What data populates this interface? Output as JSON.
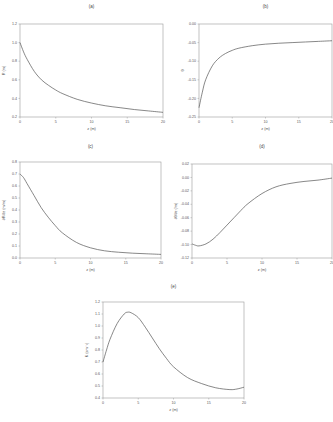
{
  "chart_data": [
    {
      "id": "a",
      "type": "line",
      "title": "(a)",
      "xlabel": "z (m)",
      "ylabel": "R (m)",
      "xlim": [
        0,
        20
      ],
      "ylim": [
        0.2,
        1.2
      ],
      "xticks": [
        "0",
        "5",
        "10",
        "15",
        "20"
      ],
      "yticks": [
        "0.2",
        "0.4",
        "0.6",
        "0.8",
        "1.0",
        "1.2"
      ],
      "grid": false,
      "x": [
        0,
        0.5,
        1,
        2,
        3,
        4,
        5,
        6,
        8,
        10,
        12,
        14,
        16,
        18,
        20
      ],
      "y": [
        1.0,
        0.9,
        0.82,
        0.69,
        0.6,
        0.54,
        0.49,
        0.45,
        0.39,
        0.35,
        0.32,
        0.3,
        0.28,
        0.265,
        0.25
      ]
    },
    {
      "id": "b",
      "type": "line",
      "title": "(b)",
      "xlabel": "z (m)",
      "ylabel": "θ",
      "xlim": [
        0,
        20
      ],
      "ylim": [
        -0.25,
        0.05
      ],
      "xticks": [
        "0",
        "5",
        "10",
        "15",
        "20"
      ],
      "yticks": [
        "-0.25",
        "-0.20",
        "-0.15",
        "-0.10",
        "-0.05",
        "0.00"
      ],
      "grid": false,
      "x": [
        0,
        0.5,
        1,
        2,
        3,
        4,
        5,
        6,
        8,
        10,
        12,
        14,
        16,
        18,
        20
      ],
      "y": [
        -0.22,
        -0.17,
        -0.13,
        -0.085,
        -0.06,
        -0.045,
        -0.035,
        -0.028,
        -0.02,
        -0.015,
        -0.012,
        -0.01,
        -0.008,
        -0.006,
        -0.004
      ]
    },
    {
      "id": "c",
      "type": "line",
      "title": "(c)",
      "xlabel": "z (m)",
      "ylabel": "∂R/∂z (m/m)",
      "xlim": [
        0,
        20
      ],
      "ylim": [
        0.0,
        0.8
      ],
      "xticks": [
        "0",
        "5",
        "10",
        "15",
        "20"
      ],
      "yticks": [
        "0.0",
        "0.1",
        "0.2",
        "0.3",
        "0.4",
        "0.5",
        "0.6",
        "0.7",
        "0.8"
      ],
      "grid": false,
      "x": [
        0,
        0.5,
        1,
        2,
        3,
        4,
        5,
        6,
        8,
        10,
        12,
        14,
        16,
        18,
        20
      ],
      "y": [
        0.7,
        0.67,
        0.62,
        0.52,
        0.42,
        0.34,
        0.27,
        0.21,
        0.13,
        0.085,
        0.06,
        0.048,
        0.04,
        0.035,
        0.03
      ]
    },
    {
      "id": "d",
      "type": "line",
      "title": "(d)",
      "xlabel": "z (m)",
      "ylabel": "∂θ/∂z (/m)",
      "xlim": [
        0,
        20
      ],
      "ylim": [
        -0.12,
        0.02
      ],
      "xticks": [
        "0",
        "5",
        "10",
        "15",
        "20"
      ],
      "yticks": [
        "-0.12",
        "-0.10",
        "-0.08",
        "-0.06",
        "-0.04",
        "-0.02",
        "0.00",
        "0.02"
      ],
      "grid": false,
      "x": [
        0,
        0.5,
        1,
        2,
        3,
        4,
        5,
        6,
        7,
        8,
        10,
        12,
        14,
        16,
        18,
        20
      ],
      "y": [
        -0.099,
        -0.101,
        -0.102,
        -0.099,
        -0.092,
        -0.082,
        -0.071,
        -0.06,
        -0.049,
        -0.039,
        -0.024,
        -0.014,
        -0.009,
        -0.006,
        -0.004,
        -0.001
      ]
    },
    {
      "id": "e",
      "type": "line",
      "title": "(e)",
      "xlabel": "z (m)",
      "ylabel": "K (sm⁻¹)",
      "xlim": [
        0,
        20
      ],
      "ylim": [
        0.4,
        1.2
      ],
      "xticks": [
        "0",
        "5",
        "10",
        "15",
        "20"
      ],
      "yticks": [
        "0.4",
        "0.5",
        "0.6",
        "0.7",
        "0.8",
        "0.9",
        "1.0",
        "1.1",
        "1.2"
      ],
      "grid": false,
      "x": [
        0,
        0.5,
        1,
        2,
        3,
        3.5,
        4,
        5,
        6,
        7,
        8,
        9,
        10,
        12,
        14,
        16,
        18,
        19,
        20
      ],
      "y": [
        0.7,
        0.8,
        0.89,
        1.02,
        1.1,
        1.115,
        1.11,
        1.07,
        0.99,
        0.9,
        0.81,
        0.73,
        0.66,
        0.57,
        0.52,
        0.485,
        0.47,
        0.475,
        0.49
      ]
    }
  ]
}
